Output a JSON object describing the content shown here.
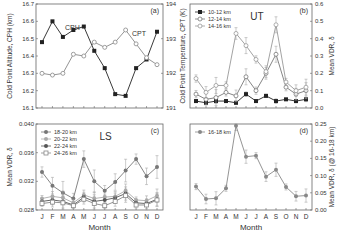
{
  "figure": {
    "months": [
      "J",
      "F",
      "M",
      "A",
      "M",
      "J",
      "J",
      "A",
      "S",
      "O",
      "N",
      "D"
    ],
    "xlabel": "Month"
  },
  "chart_data": [
    {
      "panel": "(a)",
      "type": "line",
      "categories": [
        "J",
        "F",
        "M",
        "A",
        "M",
        "J",
        "J",
        "A",
        "S",
        "O",
        "N",
        "D"
      ],
      "ylabel": "Cold Point Altitude, CPH (km)",
      "ylim": [
        16.1,
        16.7
      ],
      "yticks": [
        "16.1",
        "16.2",
        "16.3",
        "16.4",
        "16.5",
        "16.6",
        "16.7"
      ],
      "y2label": "Cold Point Temperature, CPT (K)",
      "y2lim": [
        191,
        194
      ],
      "y2ticks": [
        "191",
        "192",
        "193",
        "194"
      ],
      "series": [
        {
          "name": "CPH",
          "axis": "left",
          "marker": "filled-square",
          "color": "#222222",
          "values": [
            16.48,
            16.6,
            16.51,
            16.55,
            16.57,
            16.43,
            16.33,
            16.18,
            16.17,
            16.33,
            16.38,
            16.54
          ]
        },
        {
          "name": "CPT",
          "axis": "right",
          "marker": "open-circle",
          "color": "#888888",
          "values": [
            192.0,
            191.95,
            192.0,
            192.55,
            192.5,
            192.9,
            192.75,
            192.9,
            193.25,
            192.85,
            192.45,
            192.25
          ]
        }
      ],
      "annotations": [
        "CPH",
        "CPT"
      ]
    },
    {
      "panel": "(b)",
      "type": "line",
      "title": "UT",
      "categories": [
        "J",
        "F",
        "M",
        "A",
        "M",
        "J",
        "J",
        "A",
        "S",
        "O",
        "N",
        "D"
      ],
      "y2label": "Mean VDR, δ",
      "ylim": [
        0.0,
        0.6
      ],
      "yticks": [
        "0.0",
        "0.1",
        "0.2",
        "0.3",
        "0.4",
        "0.5",
        "0.6"
      ],
      "legend": [
        "10-12 km",
        "12-14 km",
        "14-16 km"
      ],
      "series": [
        {
          "name": "10-12 km",
          "marker": "filled-square",
          "color": "#222222",
          "values": [
            0.04,
            0.03,
            0.04,
            0.04,
            0.03,
            0.08,
            0.04,
            0.07,
            0.04,
            0.05,
            0.04,
            0.05
          ]
        },
        {
          "name": "12-14 km",
          "marker": "open-circle",
          "color": "#777777",
          "values": [
            0.08,
            0.05,
            0.06,
            0.09,
            0.07,
            0.18,
            0.1,
            0.2,
            0.31,
            0.12,
            0.08,
            0.1
          ]
        },
        {
          "name": "14-16 km",
          "marker": "open-circle",
          "color": "#999999",
          "values": [
            0.17,
            0.09,
            0.13,
            0.13,
            0.43,
            0.36,
            0.28,
            0.21,
            0.48,
            0.15,
            0.1,
            0.12
          ]
        }
      ]
    },
    {
      "panel": "(c)",
      "type": "line",
      "title": "LS",
      "categories": [
        "J",
        "F",
        "M",
        "A",
        "M",
        "J",
        "J",
        "A",
        "S",
        "O",
        "N",
        "D"
      ],
      "xlabel": "Month",
      "ylabel": "Mean VDR, δ",
      "ylim": [
        0.028,
        0.04
      ],
      "yticks": [
        "0.028",
        "0.032",
        "0.036",
        "0.040"
      ],
      "legend": [
        "18-20 km",
        "20-22 km",
        "22-24 km",
        "24-26 km"
      ],
      "series": [
        {
          "name": "18-20 km",
          "marker": "filled-circle",
          "color": "#777777",
          "values": [
            0.0333,
            0.0314,
            0.0304,
            0.0296,
            0.0351,
            0.032,
            0.0307,
            0.0319,
            0.0335,
            0.0351,
            0.0327,
            0.034
          ]
        },
        {
          "name": "20-22 km",
          "marker": "filled-circle",
          "color": "#aaaaaa",
          "values": [
            0.0296,
            0.0299,
            0.0297,
            0.029,
            0.0301,
            0.0296,
            0.0298,
            0.0299,
            0.0307,
            0.0294,
            0.0293,
            0.03
          ]
        },
        {
          "name": "22-24 km",
          "marker": "filled-circle",
          "color": "#555555",
          "values": [
            0.0292,
            0.0294,
            0.0292,
            0.0287,
            0.0298,
            0.0292,
            0.0294,
            0.0297,
            0.0303,
            0.029,
            0.0289,
            0.0295
          ]
        },
        {
          "name": "24-26 km",
          "marker": "open-square",
          "color": "#888888",
          "values": [
            0.0289,
            0.0291,
            0.029,
            0.0286,
            0.0295,
            0.0289,
            0.0286,
            0.0292,
            0.03,
            0.0287,
            0.0287,
            0.0294
          ]
        }
      ]
    },
    {
      "panel": "(d)",
      "type": "line",
      "categories": [
        "J",
        "F",
        "M",
        "A",
        "M",
        "J",
        "J",
        "A",
        "S",
        "O",
        "N",
        "D"
      ],
      "xlabel": "Month",
      "y2label": "Mean VDR, δ (@ 16-18 km)",
      "ylim": [
        0.0,
        0.25
      ],
      "yticks": [
        "0.00",
        "0.05",
        "0.10",
        "0.15",
        "0.20",
        "0.25"
      ],
      "legend": [
        "16-18 km"
      ],
      "series": [
        {
          "name": "16-18 km",
          "marker": "filled-circle",
          "color": "#888888",
          "values": [
            0.068,
            0.032,
            0.034,
            0.063,
            0.245,
            0.155,
            0.158,
            0.097,
            0.117,
            0.067,
            0.04,
            0.042
          ]
        }
      ]
    }
  ]
}
